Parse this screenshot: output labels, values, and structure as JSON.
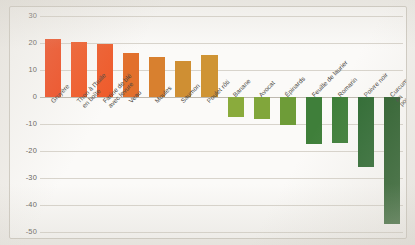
{
  "chart_data": {
    "type": "bar",
    "title": "",
    "subtitle": "",
    "xlabel": "",
    "ylabel": "",
    "ylim": [
      -50,
      30
    ],
    "yticks": [
      30,
      20,
      10,
      0,
      -10,
      -20,
      -30,
      -40,
      -50
    ],
    "ytick_labels": [
      "30",
      "20",
      "10",
      "0",
      "-10",
      "-20",
      "-30",
      "-40",
      "-50"
    ],
    "grid": true,
    "legend": "none",
    "categories": [
      "Gruyère",
      "Thon à l'huile en boîte",
      "Farine de blé avec levure",
      "Veau",
      "Moules",
      "Saumon",
      "Poulet rôti",
      "Banane",
      "Avocat",
      "Épinards",
      "Feuille de laurier",
      "Romarin",
      "Poivre noir",
      "Curcuma en poudre"
    ],
    "values": [
      21.5,
      20.5,
      19.5,
      16.5,
      15,
      13.5,
      15.5,
      -7.5,
      -8,
      -10.5,
      -17.5,
      -17,
      -26,
      -47
    ],
    "colors": [
      "#f04e23",
      "#f15a28",
      "#ef5b2b",
      "#e2702c",
      "#d8802f",
      "#cf8f33",
      "#cf9434",
      "#8aab3c",
      "#81a63b",
      "#6e9c38",
      "#3f7f3a",
      "#3f7f3a",
      "#2f6b33",
      "#2b5f2c"
    ]
  },
  "labels": {
    "lines": [
      [
        "Gruyère"
      ],
      [
        "Thon à l'huile",
        "en boîte"
      ],
      [
        "Farine de blé",
        "avec levure"
      ],
      [
        "Veau"
      ],
      [
        "Moules"
      ],
      [
        "Saumon"
      ],
      [
        "Poulet rôti"
      ],
      [
        "Banane"
      ],
      [
        "Avocat"
      ],
      [
        "Épinards"
      ],
      [
        "Feuille de laurier"
      ],
      [
        "Romarin"
      ],
      [
        "Poivre noir"
      ],
      [
        "Curcuma",
        "en poudre"
      ]
    ]
  }
}
